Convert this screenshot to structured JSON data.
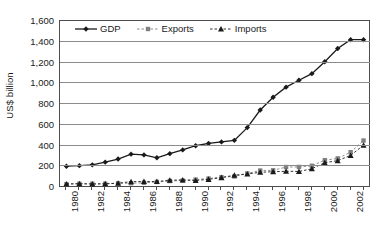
{
  "chart_data": {
    "type": "line",
    "title": "",
    "xlabel": "",
    "ylabel": "US$ billion",
    "ylim": [
      0,
      1600
    ],
    "ytick_values": [
      0,
      200,
      400,
      600,
      800,
      1000,
      1200,
      1400,
      1600
    ],
    "ytick_labels": [
      "0",
      "200",
      "400",
      "600",
      "800",
      "1,000",
      "1,200",
      "1,400",
      "1,600"
    ],
    "grid": "horizontal",
    "legend_position": "top-inside",
    "x": [
      1980,
      1981,
      1982,
      1983,
      1984,
      1985,
      1986,
      1987,
      1988,
      1989,
      1990,
      1991,
      1992,
      1993,
      1994,
      1995,
      1996,
      1997,
      1998,
      1999,
      2000,
      2001,
      2002,
      2003
    ],
    "xtick_labels": [
      "1980",
      "",
      "1982",
      "",
      "1984",
      "",
      "1986",
      "",
      "1988",
      "",
      "1990",
      "",
      "1992",
      "",
      "1994",
      "",
      "1996",
      "",
      "1998",
      "",
      "2000",
      "",
      "2002",
      ""
    ],
    "series": [
      {
        "name": "GDP",
        "marker": "diamond",
        "color": "#1a1a1a",
        "line_style": "solid",
        "values": [
          191,
          196,
          204,
          230,
          260,
          307,
          300,
          272,
          312,
          348,
          388,
          410,
          425,
          440,
          563,
          732,
          856,
          953,
          1019,
          1083,
          1198,
          1325,
          1410,
          1410
        ]
      },
      {
        "name": "Exports",
        "marker": "square",
        "color": "#808080",
        "line_style": "dashed",
        "values": [
          18,
          22,
          22,
          22,
          26,
          27,
          31,
          39,
          48,
          52,
          62,
          72,
          85,
          92,
          121,
          149,
          151,
          183,
          184,
          195,
          249,
          266,
          326,
          438
        ]
      },
      {
        "name": "Imports",
        "marker": "triangle",
        "color": "#1a1a1a",
        "line_style": "dashed",
        "values": [
          20,
          22,
          19,
          21,
          27,
          42,
          43,
          43,
          55,
          59,
          53,
          64,
          81,
          104,
          116,
          132,
          138,
          142,
          140,
          166,
          225,
          244,
          295,
          393
        ]
      }
    ]
  },
  "legend": {
    "entries": [
      {
        "label": "GDP",
        "marker": "diamond-marker-icon"
      },
      {
        "label": "Exports",
        "marker": "square-marker-icon"
      },
      {
        "label": "Imports",
        "marker": "triangle-marker-icon"
      }
    ]
  }
}
